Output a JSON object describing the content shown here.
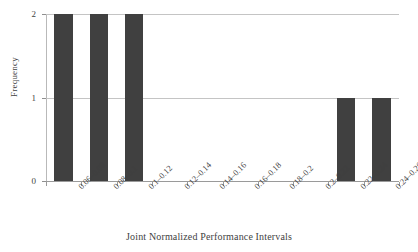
{
  "chart_data": {
    "type": "bar",
    "title": "",
    "xlabel": "Joint Normalized Performance Intervals",
    "ylabel": "Frequency",
    "categories": [
      "0.06–0.08",
      "0.08–0.1",
      "0.1–0.12",
      "0.12–0.14",
      "0.14–0.16",
      "0.16–0.18",
      "0.18–0.2",
      "0.2–0.22",
      "0.22–0.24",
      "0.24–0.26"
    ],
    "values": [
      2,
      2,
      2,
      0,
      0,
      0,
      0,
      0,
      1,
      1
    ],
    "ylim": [
      0,
      2
    ],
    "yticks": [
      "0",
      "1",
      "2"
    ],
    "ytick_values": [
      0,
      1,
      2
    ],
    "grid": true,
    "grid_axis": "y",
    "legend": false,
    "bar_color": "#404040",
    "grid_color": "#c4c4c4",
    "axis_color": "#9a9a9a",
    "background_color": "#ffffff",
    "text_color": "#3f3f3f"
  }
}
